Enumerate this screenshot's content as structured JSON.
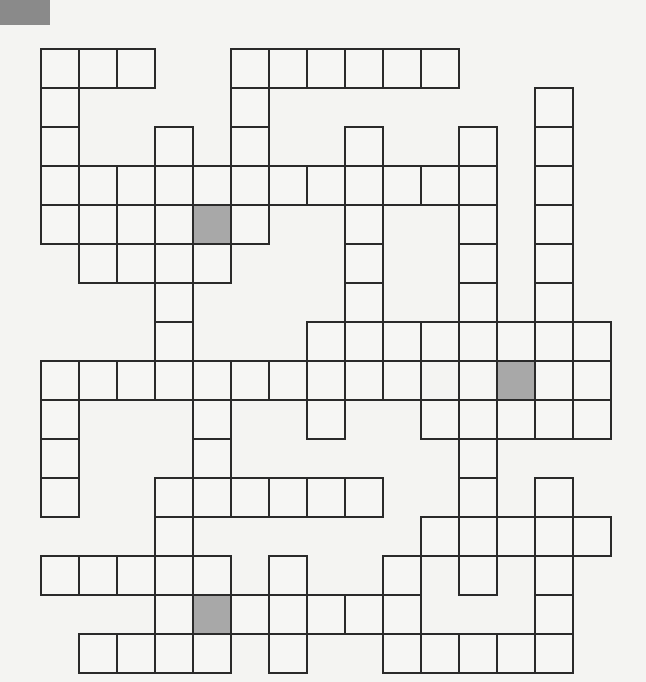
{
  "puzzle": {
    "type": "crossword",
    "origin": [
      41,
      49
    ],
    "cell_w": 38,
    "cell_h": 39,
    "cols": 15,
    "rows": 16,
    "colors": {
      "line": "#2a2a2a",
      "cell": "#f6f6f4",
      "shaded": "#a8a8a8",
      "corner": "#8a8a8a"
    },
    "white_cells": [
      [
        0,
        0
      ],
      [
        0,
        1
      ],
      [
        0,
        2
      ],
      [
        0,
        5
      ],
      [
        0,
        6
      ],
      [
        0,
        7
      ],
      [
        0,
        8
      ],
      [
        0,
        9
      ],
      [
        0,
        10
      ],
      [
        1,
        0
      ],
      [
        1,
        5
      ],
      [
        1,
        13
      ],
      [
        2,
        0
      ],
      [
        2,
        3
      ],
      [
        2,
        5
      ],
      [
        2,
        8
      ],
      [
        2,
        11
      ],
      [
        2,
        13
      ],
      [
        3,
        0
      ],
      [
        3,
        1
      ],
      [
        3,
        2
      ],
      [
        3,
        3
      ],
      [
        3,
        4
      ],
      [
        3,
        5
      ],
      [
        3,
        6
      ],
      [
        3,
        7
      ],
      [
        3,
        8
      ],
      [
        3,
        9
      ],
      [
        3,
        10
      ],
      [
        3,
        11
      ],
      [
        3,
        13
      ],
      [
        4,
        0
      ],
      [
        4,
        1
      ],
      [
        4,
        2
      ],
      [
        4,
        3
      ],
      [
        4,
        5
      ],
      [
        4,
        8
      ],
      [
        4,
        11
      ],
      [
        4,
        13
      ],
      [
        5,
        1
      ],
      [
        5,
        2
      ],
      [
        5,
        3
      ],
      [
        5,
        4
      ],
      [
        5,
        8
      ],
      [
        5,
        11
      ],
      [
        5,
        13
      ],
      [
        6,
        3
      ],
      [
        6,
        8
      ],
      [
        6,
        11
      ],
      [
        6,
        13
      ],
      [
        7,
        3
      ],
      [
        7,
        7
      ],
      [
        7,
        8
      ],
      [
        7,
        9
      ],
      [
        7,
        10
      ],
      [
        7,
        11
      ],
      [
        7,
        12
      ],
      [
        7,
        13
      ],
      [
        7,
        14
      ],
      [
        8,
        0
      ],
      [
        8,
        1
      ],
      [
        8,
        2
      ],
      [
        8,
        3
      ],
      [
        8,
        4
      ],
      [
        8,
        5
      ],
      [
        8,
        6
      ],
      [
        8,
        7
      ],
      [
        8,
        8
      ],
      [
        8,
        9
      ],
      [
        8,
        11
      ],
      [
        8,
        13
      ],
      [
        8,
        14
      ],
      [
        9,
        0
      ],
      [
        9,
        4
      ],
      [
        9,
        7
      ],
      [
        9,
        10
      ],
      [
        9,
        11
      ],
      [
        9,
        12
      ],
      [
        9,
        13
      ],
      [
        9,
        14
      ],
      [
        10,
        0
      ],
      [
        10,
        4
      ],
      [
        10,
        11
      ],
      [
        11,
        0
      ],
      [
        11,
        3
      ],
      [
        11,
        4
      ],
      [
        11,
        5
      ],
      [
        11,
        6
      ],
      [
        11,
        7
      ],
      [
        11,
        8
      ],
      [
        11,
        11
      ],
      [
        11,
        13
      ],
      [
        12,
        3
      ],
      [
        12,
        10
      ],
      [
        12,
        11
      ],
      [
        12,
        12
      ],
      [
        12,
        13
      ],
      [
        12,
        14
      ],
      [
        13,
        0
      ],
      [
        13,
        1
      ],
      [
        13,
        2
      ],
      [
        13,
        3
      ],
      [
        13,
        4
      ],
      [
        13,
        6
      ],
      [
        13,
        9
      ],
      [
        13,
        11
      ],
      [
        13,
        13
      ],
      [
        14,
        3
      ],
      [
        14,
        5
      ],
      [
        14,
        6
      ],
      [
        14,
        7
      ],
      [
        14,
        8
      ],
      [
        14,
        9
      ],
      [
        14,
        13
      ],
      [
        15,
        1
      ],
      [
        15,
        2
      ],
      [
        15,
        3
      ],
      [
        15,
        4
      ],
      [
        15,
        6
      ],
      [
        15,
        9
      ],
      [
        15,
        10
      ],
      [
        15,
        11
      ],
      [
        15,
        12
      ],
      [
        15,
        13
      ]
    ],
    "shaded_cells": [
      [
        4,
        4
      ],
      [
        8,
        12
      ],
      [
        14,
        4
      ]
    ]
  }
}
